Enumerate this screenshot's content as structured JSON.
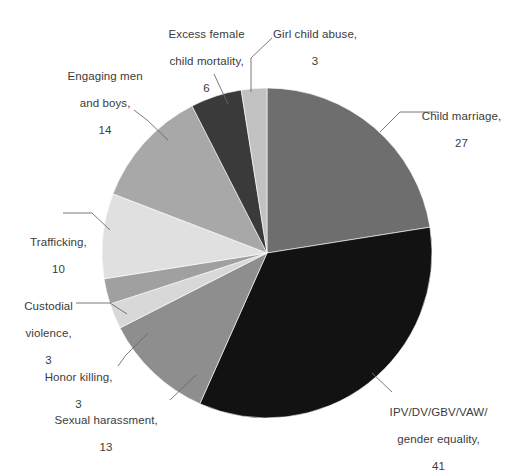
{
  "chart_data": {
    "type": "pie",
    "title": "",
    "xlabel": "",
    "ylabel": "",
    "total": 141,
    "legend_position": "callout-labels",
    "grid": false,
    "start_angle_deg": 0,
    "direction": "clockwise",
    "categories": [
      "Child marriage",
      "IPV/DV/GBV/VAW/\ngender equality",
      "Sexual harassment",
      "Honor killing",
      "Custodial violence",
      "Trafficking",
      "Engaging men\nand boys",
      "Excess female\nchild mortality",
      "Girl child abuse"
    ],
    "values": [
      27,
      41,
      13,
      3,
      3,
      10,
      14,
      6,
      3
    ],
    "colors": [
      "#6e6e6e",
      "#121212",
      "#8e8e8e",
      "#d8d8d8",
      "#a0a0a0",
      "#e0e0e0",
      "#a8a8a8",
      "#3a3a3a",
      "#c2c2c2"
    ],
    "slices": [
      {
        "label": "Child marriage",
        "value": 27,
        "color": "#6e6e6e"
      },
      {
        "label": "IPV/DV/GBV/VAW/ gender equality",
        "value": 41,
        "color": "#121212"
      },
      {
        "label": "Sexual harassment",
        "value": 13,
        "color": "#8e8e8e"
      },
      {
        "label": "Honor killing",
        "value": 3,
        "color": "#d8d8d8"
      },
      {
        "label": "Custodial violence",
        "value": 3,
        "color": "#a0a0a0"
      },
      {
        "label": "Trafficking",
        "value": 10,
        "color": "#e0e0e0"
      },
      {
        "label": "Engaging men and boys",
        "value": 14,
        "color": "#a8a8a8"
      },
      {
        "label": "Excess female child mortality",
        "value": 6,
        "color": "#3a3a3a"
      },
      {
        "label": "Girl child abuse",
        "value": 3,
        "color": "#c2c2c2"
      }
    ]
  },
  "labels": {
    "child_marriage": {
      "line1": "Child marriage,",
      "line2": "27"
    },
    "ipv": {
      "line1": "IPV/DV/GBV/VAW/",
      "line2": "gender equality,",
      "line3": "41"
    },
    "sexual_harassment": {
      "line1": "Sexual harassment,",
      "line2": "13"
    },
    "honor_killing": {
      "line1": "Honor killing,",
      "line2": "3"
    },
    "custodial_violence": {
      "line1": "Custodial",
      "line2": "violence,",
      "line3": "3"
    },
    "trafficking": {
      "line1": "Trafficking,",
      "line2": "10"
    },
    "engaging_men": {
      "line1": "Engaging men",
      "line2": "and boys,",
      "line3": "14"
    },
    "excess_female_mortality": {
      "line1": "Excess female",
      "line2": "child mortality,",
      "line3": "6"
    },
    "girl_child_abuse": {
      "line1": "Girl child abuse,",
      "line2": "3"
    }
  },
  "geometry": {
    "cx": 267,
    "cy": 253,
    "r": 165
  }
}
